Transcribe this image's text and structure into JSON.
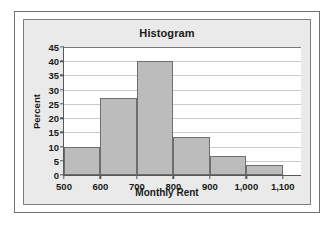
{
  "chart_data": {
    "type": "bar",
    "title": "Histogram",
    "xlabel": "Monthly Rent",
    "ylabel": "Percent",
    "grid": true,
    "legend": false,
    "bin_edges": [
      500,
      600,
      700,
      800,
      900,
      1000,
      1100
    ],
    "categories": [
      "500-600",
      "600-700",
      "700-800",
      "800-900",
      "900-1,000",
      "1,000-1,100"
    ],
    "values": [
      10,
      27,
      40,
      13.3,
      6.8,
      3.5
    ],
    "xlim": [
      500,
      1150
    ],
    "ylim": [
      0,
      45
    ],
    "x_tick_values": [
      500,
      600,
      700,
      800,
      900,
      1000,
      1100
    ],
    "x_tick_labels": [
      "500",
      "600",
      "700",
      "800",
      "900",
      "1,000",
      "1,100"
    ],
    "y_tick_values": [
      0,
      5,
      10,
      15,
      20,
      25,
      30,
      35,
      40,
      45
    ],
    "y_tick_labels": [
      "0",
      "5",
      "10",
      "15",
      "20",
      "25",
      "30",
      "35",
      "40",
      "45"
    ],
    "bar_color": "#bcbcbc",
    "bar_edge_color": "#6e6e6e",
    "grid_color": "#c9c9c9",
    "axis_color": "#585858",
    "panel_color": "#eaeaea",
    "plot_background": "#ffffff"
  }
}
